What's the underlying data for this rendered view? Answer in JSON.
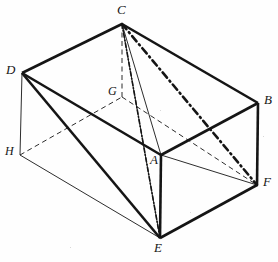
{
  "figure": {
    "background_color": "#fefefe",
    "ink_color": "#151515",
    "width": 278,
    "height": 262
  },
  "chart_data": {
    "type": "diagram",
    "title": "",
    "subtype": "3d-solid-geometry-rectangular-prism",
    "vertices": [
      {
        "id": "C",
        "label": "C",
        "x": 122,
        "y": 24,
        "label_x": 117,
        "label_y": 3,
        "hidden": false
      },
      {
        "id": "D",
        "label": "D",
        "x": 22,
        "y": 73,
        "label_x": 6,
        "label_y": 63,
        "hidden": false
      },
      {
        "id": "B",
        "label": "B",
        "x": 258,
        "y": 103,
        "label_x": 264,
        "label_y": 93,
        "hidden": false
      },
      {
        "id": "G",
        "label": "G",
        "x": 122,
        "y": 97,
        "label_x": 108,
        "label_y": 85,
        "hidden": true
      },
      {
        "id": "H",
        "label": "H",
        "x": 20,
        "y": 155,
        "label_x": 5,
        "label_y": 145,
        "hidden": true
      },
      {
        "id": "A",
        "label": "A",
        "x": 161,
        "y": 155,
        "label_x": 150,
        "label_y": 153,
        "hidden": false
      },
      {
        "id": "F",
        "label": "F",
        "x": 257,
        "y": 185,
        "label_x": 263,
        "label_y": 175,
        "hidden": false
      },
      {
        "id": "E",
        "label": "E",
        "x": 160,
        "y": 238,
        "label_x": 154,
        "label_y": 241,
        "hidden": false
      }
    ],
    "edges": [
      {
        "from": "D",
        "to": "C",
        "style": "solid",
        "weight": "thick",
        "name": "edge-DC"
      },
      {
        "from": "C",
        "to": "B",
        "style": "solid",
        "weight": "thick",
        "name": "edge-CB"
      },
      {
        "from": "D",
        "to": "A",
        "style": "solid",
        "weight": "thick",
        "name": "edge-DA"
      },
      {
        "from": "A",
        "to": "B",
        "style": "solid",
        "weight": "thick",
        "name": "edge-AB"
      },
      {
        "from": "B",
        "to": "F",
        "style": "solid",
        "weight": "thick",
        "name": "edge-BF"
      },
      {
        "from": "A",
        "to": "E",
        "style": "solid",
        "weight": "thick",
        "name": "edge-AE"
      },
      {
        "from": "D",
        "to": "H",
        "style": "solid",
        "weight": "thin",
        "name": "edge-DH"
      },
      {
        "from": "D",
        "to": "E",
        "style": "solid",
        "weight": "thick",
        "name": "edge-DE"
      },
      {
        "from": "E",
        "to": "F",
        "style": "solid",
        "weight": "thick",
        "name": "edge-EF"
      },
      {
        "from": "H",
        "to": "E",
        "style": "solid",
        "weight": "thin",
        "name": "edge-HE"
      },
      {
        "from": "A",
        "to": "F",
        "style": "solid",
        "weight": "thin",
        "name": "edge-AF"
      },
      {
        "from": "H",
        "to": "G",
        "style": "dashed",
        "weight": "thin",
        "name": "edge-HG"
      },
      {
        "from": "G",
        "to": "F",
        "style": "dashed",
        "weight": "thin",
        "name": "edge-GF"
      },
      {
        "from": "C",
        "to": "G",
        "style": "dashed",
        "weight": "thin",
        "name": "edge-CG"
      },
      {
        "from": "C",
        "to": "A",
        "style": "solid",
        "weight": "thin",
        "name": "cevian-CA"
      },
      {
        "from": "C",
        "to": "E",
        "style": "solid",
        "weight": "thin",
        "name": "cevian-CE"
      },
      {
        "from": "C",
        "to": "F",
        "style": "dashdot",
        "weight": "thick",
        "name": "cevian-CF"
      },
      {
        "from": "C",
        "to": "E",
        "style": "dashdot",
        "weight": "medium",
        "name": "cevian-CE-dashdot"
      }
    ],
    "labels": [
      "A",
      "B",
      "C",
      "D",
      "E",
      "F",
      "G",
      "H"
    ],
    "hidden_vertices": [
      "G",
      "H"
    ],
    "legend": [],
    "annotations": []
  }
}
